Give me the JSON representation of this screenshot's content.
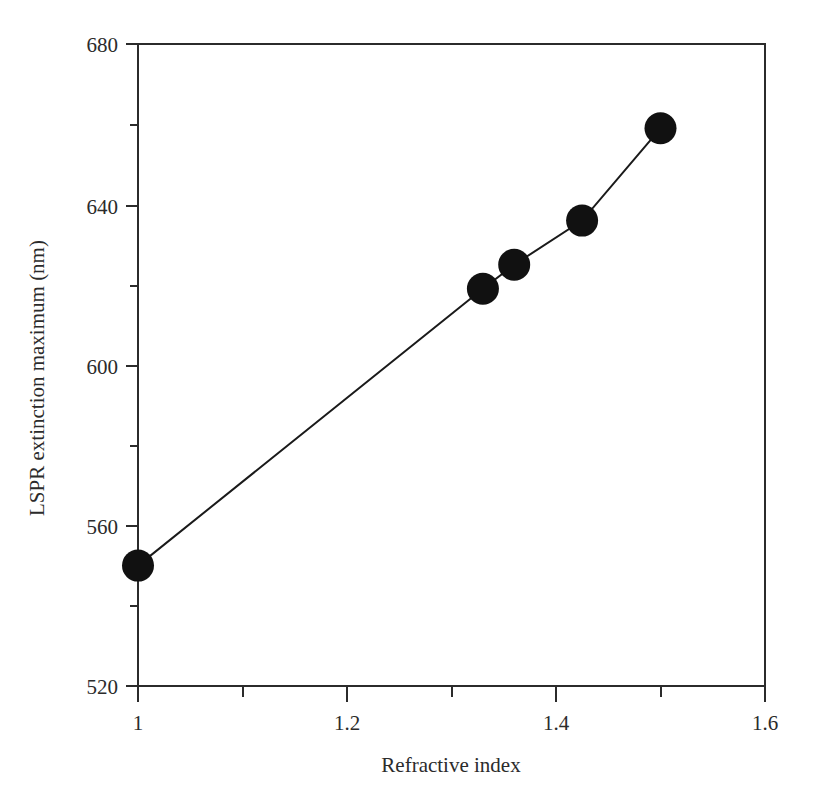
{
  "chart_data": {
    "type": "line",
    "title": "",
    "xlabel": "Refractive index",
    "ylabel": "LSPR extinction maximum (nm)",
    "xlim": [
      1.0,
      1.6
    ],
    "ylim": [
      520,
      680
    ],
    "x_major_ticks": [
      1,
      1.2,
      1.4,
      1.6
    ],
    "x_major_tick_labels": [
      "1",
      "1.2",
      "1.4",
      "1.6"
    ],
    "x_minor_ticks": [
      1.1,
      1.3,
      1.5
    ],
    "y_major_ticks": [
      520,
      560,
      600,
      640,
      680
    ],
    "y_major_tick_labels": [
      "520",
      "560",
      "600",
      "640",
      "680"
    ],
    "y_minor_ticks": [
      540,
      580,
      620,
      660
    ],
    "grid": false,
    "legend": null,
    "marker": "filled-circle",
    "marker_color": "#111111",
    "line_color": "#1a1a1a",
    "frame": true,
    "x": [
      1.0,
      1.33,
      1.36,
      1.425,
      1.5
    ],
    "y": [
      550,
      619,
      625,
      636,
      659
    ],
    "points": [
      {
        "x": 1.0,
        "y": 550
      },
      {
        "x": 1.33,
        "y": 619
      },
      {
        "x": 1.36,
        "y": 625
      },
      {
        "x": 1.425,
        "y": 636
      },
      {
        "x": 1.5,
        "y": 659
      }
    ]
  },
  "axes": {
    "y_title": "LSPR extinction maximum (nm)",
    "x_title": "Refractive index",
    "y_labels": [
      "680",
      "640",
      "600",
      "560",
      "520"
    ],
    "x_labels": [
      "1",
      "1.2",
      "1.4",
      "1.6"
    ]
  },
  "colors": {
    "background": "#ffffff",
    "axis": "#2b2b2b",
    "marker": "#111111",
    "line": "#1a1a1a",
    "text": "#2b2b2b"
  }
}
